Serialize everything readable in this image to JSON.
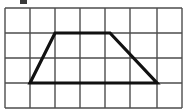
{
  "figure": {
    "title": ""
  },
  "chart_data": {
    "type": "diagram",
    "title": "",
    "xlabel": "",
    "ylabel": "",
    "grid": {
      "visible": true,
      "cols": 7,
      "rows": 4,
      "cell_width": 25,
      "cell_height": 25,
      "origin_x": 5,
      "origin_y": 8,
      "line_color": "#4d4d4d",
      "line_width": 1.4,
      "x_lines": [
        5,
        30,
        55,
        80,
        105,
        130,
        157,
        182
      ],
      "y_lines": [
        8,
        33,
        58,
        83,
        108
      ]
    },
    "shapes": [
      {
        "name": "trapezoid",
        "kind": "polygon",
        "closed": true,
        "stroke_color": "#111111",
        "stroke_width": 3.2,
        "fill": "none",
        "vertices": [
          {
            "label": "bottom-left",
            "x": 30,
            "y": 83,
            "grid_x": 1,
            "grid_y": 3
          },
          {
            "label": "top-left",
            "x": 55,
            "y": 33,
            "grid_x": 2,
            "grid_y": 1
          },
          {
            "label": "top-right",
            "x": 110,
            "y": 33,
            "grid_x": 4.2,
            "grid_y": 1
          },
          {
            "label": "bottom-right",
            "x": 157,
            "y": 83,
            "grid_x": 6.08,
            "grid_y": 3
          }
        ],
        "edges": [
          {
            "name": "left-leg",
            "from": "bottom-left",
            "to": "top-left"
          },
          {
            "name": "top-base",
            "from": "top-left",
            "to": "top-right"
          },
          {
            "name": "right-leg",
            "from": "top-right",
            "to": "bottom-right"
          },
          {
            "name": "bottom-base",
            "from": "bottom-right",
            "to": "bottom-left"
          }
        ]
      }
    ],
    "artifacts": [
      {
        "name": "cropped-glyph",
        "x": 20,
        "y": 0,
        "width": 7,
        "height": 4,
        "color": "#3a3a3a"
      }
    ]
  }
}
